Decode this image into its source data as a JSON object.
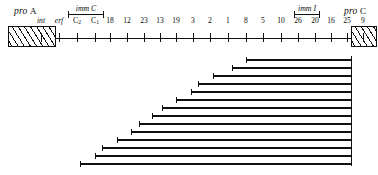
{
  "figure": {
    "type": "deletion-map",
    "background": "#ffffff",
    "ink_color": "#111111"
  },
  "left_marker": {
    "label_italic": "pro",
    "label_upright": "A",
    "name": "pro A"
  },
  "right_marker": {
    "label_italic": "pro",
    "label_upright": "C",
    "name": "pro C"
  },
  "axis": {
    "x_start": 110,
    "x_end": 345,
    "y": 38,
    "tick_height": 9,
    "ticks": [
      {
        "label": "int",
        "italic": true,
        "sub": "",
        "x": 41
      },
      {
        "label": "erf",
        "italic": true,
        "sub": "",
        "x": 59
      },
      {
        "label": "C",
        "italic": false,
        "sub": "2",
        "x": 77
      },
      {
        "label": "C",
        "italic": false,
        "sub": "1",
        "x": 95
      },
      {
        "label": "18",
        "italic": false,
        "sub": "",
        "x": 110
      },
      {
        "label": "12",
        "italic": false,
        "sub": "",
        "x": 127
      },
      {
        "label": "23",
        "italic": false,
        "sub": "",
        "x": 144
      },
      {
        "label": "13",
        "italic": false,
        "sub": "",
        "x": 160
      },
      {
        "label": "19",
        "italic": false,
        "sub": "",
        "x": 176
      },
      {
        "label": "3",
        "italic": false,
        "sub": "",
        "x": 193
      },
      {
        "label": "2",
        "italic": false,
        "sub": "",
        "x": 210
      },
      {
        "label": "1",
        "italic": false,
        "sub": "",
        "x": 228
      },
      {
        "label": "8",
        "italic": false,
        "sub": "",
        "x": 246
      },
      {
        "label": "5",
        "italic": false,
        "sub": "",
        "x": 263
      },
      {
        "label": "10",
        "italic": false,
        "sub": "",
        "x": 281
      },
      {
        "label": "26",
        "italic": false,
        "sub": "",
        "x": 298
      },
      {
        "label": "20",
        "italic": false,
        "sub": "",
        "x": 315
      },
      {
        "label": "16",
        "italic": false,
        "sub": "",
        "x": 331
      },
      {
        "label": "25",
        "italic": false,
        "sub": "",
        "x": 347
      },
      {
        "label": "9",
        "italic": false,
        "sub": "",
        "x": 363
      }
    ]
  },
  "imm_regions": [
    {
      "label": "imm C",
      "x_left": 68,
      "x_right": 104,
      "y": 4
    },
    {
      "label": "imm I",
      "x_left": 294,
      "x_right": 320,
      "y": 4
    }
  ],
  "deletions": {
    "right_end_x": 351,
    "spine_top": 56,
    "spine_bottom": 166,
    "bars": [
      {
        "x_left": 246,
        "y": 59
      },
      {
        "x_left": 232,
        "y": 67
      },
      {
        "x_left": 213,
        "y": 75
      },
      {
        "x_left": 198,
        "y": 83
      },
      {
        "x_left": 191,
        "y": 91
      },
      {
        "x_left": 176,
        "y": 99
      },
      {
        "x_left": 162,
        "y": 107
      },
      {
        "x_left": 152,
        "y": 115
      },
      {
        "x_left": 139,
        "y": 123
      },
      {
        "x_left": 131,
        "y": 131
      },
      {
        "x_left": 117,
        "y": 139
      },
      {
        "x_left": 102,
        "y": 147
      },
      {
        "x_left": 95,
        "y": 155
      },
      {
        "x_left": 80,
        "y": 163
      }
    ]
  }
}
